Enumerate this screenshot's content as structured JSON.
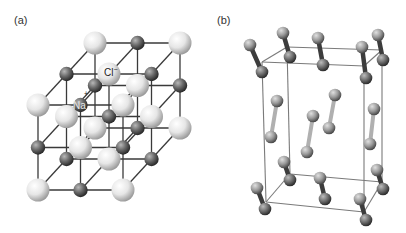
{
  "figure": {
    "panels": [
      {
        "id": "a",
        "label": "(a)",
        "title": "NaCl rock-salt crystal lattice",
        "atom_labels": {
          "sodium": "Na",
          "sodium_charge": "+",
          "chloride": "Cl",
          "chloride_charge": "−"
        }
      },
      {
        "id": "b",
        "label": "(b)",
        "title": "Molecular crystal unit cell of diatomic molecules"
      }
    ]
  },
  "colors": {
    "chloride_light": "#f4f4f4",
    "chloride_shade": "#a8a8a8",
    "sodium_light": "#9a9a9a",
    "sodium_shade": "#2e2e2e",
    "bond_line": "#3a3a3a",
    "cell_line": "#808080",
    "molecule_light": "#c8c8c8",
    "molecule_dark": "#3c3c3c"
  }
}
